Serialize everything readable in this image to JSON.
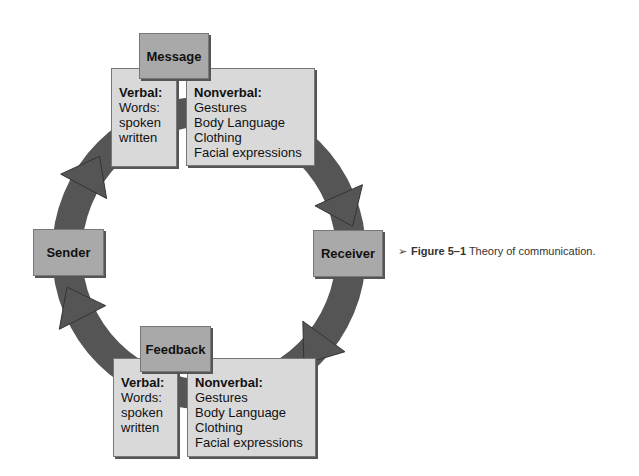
{
  "diagram": {
    "nodes": {
      "sender": "Sender",
      "receiver": "Receiver",
      "message": "Message",
      "feedback": "Feedback"
    },
    "flow": [
      "Sender",
      "Message",
      "Receiver",
      "Feedback",
      "Sender"
    ],
    "message_panel": {
      "verbal": {
        "title": "Verbal:",
        "items": [
          "Words:",
          "spoken",
          "written"
        ]
      },
      "nonverbal": {
        "title": "Nonverbal:",
        "items": [
          "Gestures",
          "Body Language",
          "Clothing",
          "Facial expressions"
        ]
      }
    },
    "feedback_panel": {
      "verbal": {
        "title": "Verbal:",
        "items": [
          "Words:",
          "spoken",
          "written"
        ]
      },
      "nonverbal": {
        "title": "Nonverbal:",
        "items": [
          "Gestures",
          "Body Language",
          "Clothing",
          "Facial expressions"
        ]
      }
    }
  },
  "caption": {
    "marker": "➢",
    "figure_label": "Figure 5–1",
    "text": "Theory of communication."
  },
  "colors": {
    "ring": "#555555",
    "header_box": "#a9a9a9",
    "content_box": "#d9d9d9"
  }
}
